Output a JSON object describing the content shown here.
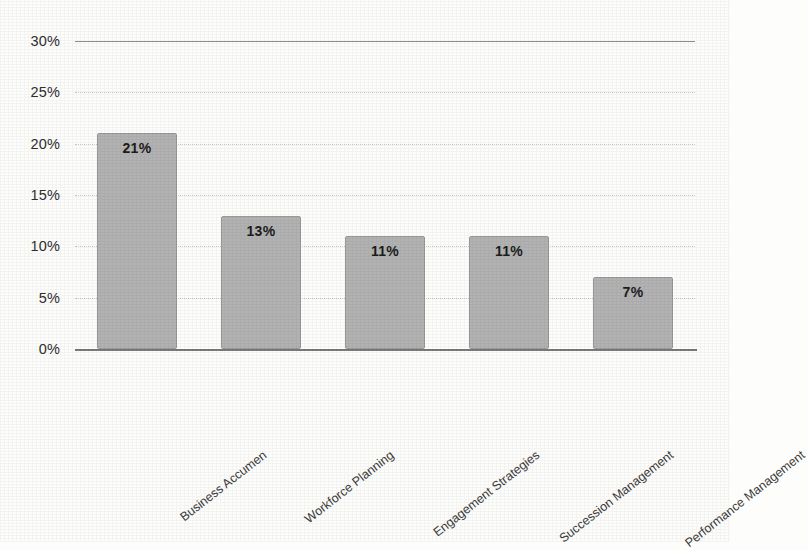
{
  "chart_data": {
    "type": "bar",
    "title": "",
    "subtitle": "",
    "xlabel": "",
    "ylabel": "",
    "categories": [
      "Business Accumen",
      "Workforce Planning",
      "Engagement Strategies",
      "Succession Management",
      "Performance Management"
    ],
    "values": [
      21,
      13,
      11,
      11,
      7
    ],
    "data_labels": [
      "21%",
      "13%",
      "11%",
      "11%",
      "7%"
    ],
    "ylim": [
      0,
      30
    ],
    "ytick_values": [
      0,
      5,
      10,
      15,
      20,
      25,
      30
    ],
    "ytick_labels": [
      "0%",
      "5%",
      "10%",
      "15%",
      "20%",
      "25%",
      "30%"
    ],
    "grid": true,
    "legend": false,
    "legend_position": "none",
    "colors": {
      "bar_fill": "#b2b2b2",
      "bar_border": "#9a9a9a",
      "gridline": "#c9c9c9",
      "axis_line": "#7a7a7a",
      "label_text": "#1c1c1c",
      "tick_text": "#2f2f2f",
      "background": "#fdfdfb"
    }
  }
}
